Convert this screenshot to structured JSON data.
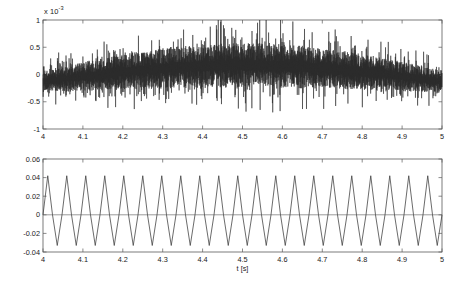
{
  "figure": {
    "background_color": "#ffffff",
    "trace_color": "#2a2a2a",
    "frame_color": "#5a5a5a"
  },
  "chart_data": [
    {
      "id": "top",
      "type": "line",
      "title": "",
      "xlabel": "",
      "ylabel": "",
      "exponent_label": "x 10",
      "exponent_value": "-3",
      "xlim": [
        4,
        5
      ],
      "ylim": [
        -1,
        1
      ],
      "grid": false,
      "legend": null,
      "xticks": [
        4,
        4.1,
        4.2,
        4.3,
        4.4,
        4.5,
        4.6,
        4.7,
        4.8,
        4.9,
        5
      ],
      "xticklabels": [
        "4",
        "4.1",
        "4.2",
        "4.3",
        "4.4",
        "4.5",
        "4.6",
        "4.7",
        "4.8",
        "4.9",
        "5"
      ],
      "yticks": [
        -1,
        -0.5,
        0,
        0.5,
        1
      ],
      "yticklabels": [
        "-1",
        "-0.5",
        "0",
        "0.5",
        "1"
      ],
      "description": "Dense high-frequency noisy signal whose envelope forms a broad arch rising from t=4 to a maximum near t=4.5 and descending toward t=5",
      "series": [
        {
          "name": "noise-signal",
          "envelope_scale": 1.0,
          "envelope_shape": "arch",
          "envelope_peak_x": 4.5,
          "band_half_width": 0.3,
          "spike_half_width": 0.62,
          "n_samples": 2600,
          "seed": 20477
        }
      ]
    },
    {
      "id": "bottom",
      "type": "line",
      "title": "",
      "xlabel": "t [s]",
      "ylabel": "",
      "xlim": [
        4,
        5
      ],
      "ylim": [
        -0.04,
        0.06
      ],
      "grid": false,
      "legend": null,
      "xticks": [
        4,
        4.1,
        4.2,
        4.3,
        4.4,
        4.5,
        4.6,
        4.7,
        4.8,
        4.9,
        5
      ],
      "xticklabels": [
        "4",
        "4.1",
        "4.2",
        "4.3",
        "4.4",
        "4.5",
        "4.6",
        "4.7",
        "4.8",
        "4.9",
        "5"
      ],
      "yticks": [
        -0.04,
        -0.02,
        0,
        0.02,
        0.04,
        0.06
      ],
      "yticklabels": [
        "-0.04",
        "-0.02",
        "0",
        "0.02",
        "0.04",
        "0.06"
      ],
      "description": "Triangular carrier waveform, approximately 21 cycles across the one second window, peaks near 0.042 and troughs near -0.033, with a flat zero reference line",
      "series": [
        {
          "name": "triangle-wave",
          "waveform": "triangle",
          "cycles": 21,
          "peak": 0.042,
          "trough": -0.033,
          "zero_reference": 0
        }
      ]
    }
  ]
}
